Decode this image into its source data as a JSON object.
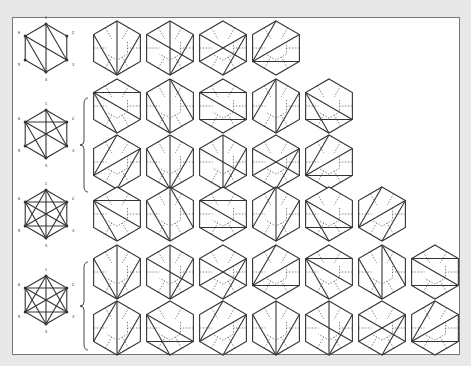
{
  "colors": {
    "background": "#e8e8e8",
    "panel": "#ffffff",
    "panel_border": "#777777",
    "stroke": "#333333",
    "dual": "#666666"
  },
  "hexagon": {
    "radius": 27,
    "spacing": 53,
    "first_x": 117
  },
  "reference_labels": [
    "1",
    "2",
    "3",
    "4",
    "5",
    "6"
  ],
  "groups": [
    {
      "name": "group-1",
      "ref": {
        "cx": 46,
        "cy": 48,
        "diagonals": [
          [
            0,
            3
          ],
          [
            0,
            2
          ],
          [
            5,
            2
          ],
          [
            5,
            3
          ]
        ]
      },
      "rows": [
        {
          "cy": 48,
          "count": 4
        }
      ],
      "brace": false
    },
    {
      "name": "group-2",
      "ref": {
        "cx": 46,
        "cy": 134,
        "diagonals": [
          [
            0,
            3
          ],
          [
            0,
            2
          ],
          [
            5,
            2
          ],
          [
            5,
            3
          ],
          [
            1,
            4
          ],
          [
            1,
            5
          ]
        ]
      },
      "rows": [
        {
          "cy": 106,
          "count": 5
        },
        {
          "cy": 162,
          "count": 5
        }
      ],
      "brace": true,
      "brace_y": [
        98,
        192
      ]
    },
    {
      "name": "group-3",
      "ref": {
        "cx": 46,
        "cy": 214,
        "diagonals": [
          [
            0,
            3
          ],
          [
            0,
            2
          ],
          [
            0,
            4
          ],
          [
            5,
            1
          ],
          [
            5,
            2
          ],
          [
            5,
            3
          ],
          [
            1,
            3
          ],
          [
            1,
            4
          ],
          [
            2,
            4
          ]
        ]
      },
      "rows": [
        {
          "cy": 214,
          "count": 6
        }
      ],
      "brace": false
    },
    {
      "name": "group-4",
      "ref": {
        "cx": 46,
        "cy": 300,
        "diagonals": [
          [
            0,
            2
          ],
          [
            0,
            3
          ],
          [
            0,
            4
          ],
          [
            1,
            3
          ],
          [
            1,
            4
          ],
          [
            1,
            5
          ],
          [
            2,
            4
          ],
          [
            2,
            5
          ],
          [
            3,
            5
          ]
        ]
      },
      "rows": [
        {
          "cy": 272,
          "count": 7
        },
        {
          "cy": 328,
          "count": 7
        }
      ],
      "brace": true,
      "brace_y": [
        262,
        350
      ]
    }
  ],
  "triangulations": [
    [
      [
        3,
        0
      ],
      [
        3,
        1
      ],
      [
        3,
        5
      ]
    ],
    [
      [
        0,
        3
      ],
      [
        1,
        3
      ],
      [
        5,
        2
      ]
    ],
    [
      [
        1,
        4
      ],
      [
        1,
        3
      ],
      [
        5,
        2
      ]
    ],
    [
      [
        0,
        4
      ],
      [
        1,
        4
      ],
      [
        2,
        4
      ]
    ],
    [
      [
        5,
        1
      ],
      [
        5,
        2
      ],
      [
        5,
        3
      ]
    ],
    [
      [
        0,
        2
      ],
      [
        0,
        3
      ],
      [
        3,
        5
      ]
    ],
    [
      [
        1,
        5
      ],
      [
        2,
        5
      ],
      [
        2,
        4
      ]
    ],
    [
      [
        0,
        3
      ],
      [
        1,
        3
      ],
      [
        0,
        4
      ]
    ],
    [
      [
        5,
        2
      ],
      [
        5,
        3
      ],
      [
        2,
        4
      ]
    ],
    [
      [
        1,
        4
      ],
      [
        1,
        3
      ],
      [
        4,
        0
      ]
    ]
  ]
}
